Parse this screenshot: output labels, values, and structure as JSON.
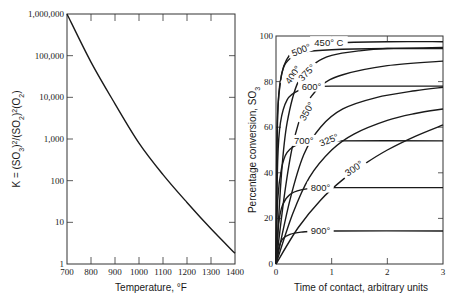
{
  "chart_data": [
    {
      "type": "line",
      "title": "",
      "xlabel": "Temperature, °F",
      "ylabel": "K = (pSO₃)²/(pSO₂)²(pO₂)",
      "ylabel_parts": [
        "K = (",
        "SO",
        "3",
        ")",
        "2",
        "/(",
        "SO",
        "2",
        ")",
        "2",
        "(",
        "O",
        "2",
        ")"
      ],
      "xlim": [
        700,
        1400
      ],
      "ylim": [
        1,
        1000000
      ],
      "yscale": "log",
      "grid": false,
      "x_ticks": [
        700,
        800,
        900,
        1000,
        1100,
        1200,
        1300,
        1400
      ],
      "x_tick_labels": [
        "700",
        "800",
        "900",
        "1000",
        "1100",
        "1200",
        "1300",
        "1400"
      ],
      "y_ticks": [
        1,
        10,
        100,
        1000,
        10000,
        100000,
        1000000
      ],
      "y_tick_labels": [
        "1",
        "10",
        "100",
        "1,000",
        "10,000",
        "100,000",
        "1,000,000"
      ],
      "series": [
        {
          "name": "K",
          "x": [
            700,
            800,
            900,
            1000,
            1100,
            1200,
            1300,
            1400
          ],
          "y": [
            1000000,
            70000,
            7000,
            800,
            140,
            30,
            7,
            1.8
          ]
        }
      ]
    },
    {
      "type": "line",
      "title": "",
      "xlabel": "Time of contact, arbitrary units",
      "ylabel": "Percentage conversion, SO₃",
      "ylabel_parts": [
        "Percentage conversion, SO",
        "3"
      ],
      "xlim": [
        0,
        3
      ],
      "ylim": [
        0,
        100
      ],
      "grid": false,
      "x_ticks": [
        0,
        1,
        2,
        3
      ],
      "x_tick_labels": [
        "0",
        "1",
        "2",
        "3"
      ],
      "y_ticks": [
        0,
        20,
        40,
        60,
        80,
        100
      ],
      "y_tick_labels": [
        "0",
        "20",
        "40",
        "60",
        "80",
        "100"
      ],
      "series": [
        {
          "name": "450° C",
          "label": "450° C",
          "x": [
            0,
            0.03,
            0.1,
            0.2,
            0.35,
            0.6,
            1,
            2,
            3
          ],
          "y": [
            0,
            65,
            83,
            90,
            94,
            96,
            97,
            97.5,
            97.5
          ]
        },
        {
          "name": "500°",
          "label": "500°",
          "x": [
            0,
            0.02,
            0.08,
            0.15,
            0.3,
            0.5,
            1,
            2,
            3
          ],
          "y": [
            0,
            60,
            80,
            87,
            91,
            93,
            94,
            94.5,
            94.5
          ]
        },
        {
          "name": "400°",
          "label": "400°",
          "x": [
            0,
            0.1,
            0.2,
            0.4,
            0.7,
            1,
            1.5,
            2,
            3
          ],
          "y": [
            0,
            40,
            62,
            80,
            88,
            91.5,
            93.5,
            94.5,
            95
          ]
        },
        {
          "name": "375°",
          "label": "375°",
          "x": [
            0,
            0.15,
            0.3,
            0.5,
            0.8,
            1.2,
            2,
            3
          ],
          "y": [
            0,
            30,
            52,
            68,
            78,
            83,
            87,
            89
          ]
        },
        {
          "name": "600°",
          "label": "600°",
          "x": [
            0,
            0.03,
            0.08,
            0.2,
            0.4,
            0.7,
            1,
            3
          ],
          "y": [
            0,
            45,
            62,
            72,
            76,
            77.5,
            78,
            78
          ]
        },
        {
          "name": "350°",
          "label": "350°",
          "x": [
            0,
            0.25,
            0.5,
            0.8,
            1.2,
            1.8,
            2.5,
            3
          ],
          "y": [
            0,
            28,
            48,
            60,
            68,
            73,
            76,
            77.5
          ]
        },
        {
          "name": "700°",
          "label": "700°",
          "x": [
            0,
            0.03,
            0.1,
            0.2,
            0.4,
            0.7,
            1,
            3
          ],
          "y": [
            0,
            28,
            42,
            49,
            52.5,
            53.5,
            54,
            54
          ]
        },
        {
          "name": "325°",
          "label": "325°",
          "x": [
            0,
            0.3,
            0.6,
            1,
            1.4,
            2,
            2.5,
            3
          ],
          "y": [
            0,
            22,
            38,
            50,
            57,
            63,
            66,
            68
          ]
        },
        {
          "name": "300°",
          "label": "300°",
          "x": [
            0,
            0.4,
            0.8,
            1.2,
            1.6,
            2,
            2.5,
            3
          ],
          "y": [
            0,
            16,
            28,
            37,
            44,
            50,
            56,
            61
          ]
        },
        {
          "name": "800°",
          "label": "800°",
          "x": [
            0,
            0.05,
            0.12,
            0.25,
            0.45,
            0.7,
            1,
            3
          ],
          "y": [
            0,
            18,
            26,
            30.5,
            32.5,
            33.3,
            33.5,
            33.5
          ]
        },
        {
          "name": "900°",
          "label": "900°",
          "x": [
            0,
            0.05,
            0.12,
            0.25,
            0.45,
            0.7,
            1,
            3
          ],
          "y": [
            0,
            7,
            11,
            13,
            14,
            14.3,
            14.5,
            14.5
          ]
        }
      ]
    }
  ]
}
